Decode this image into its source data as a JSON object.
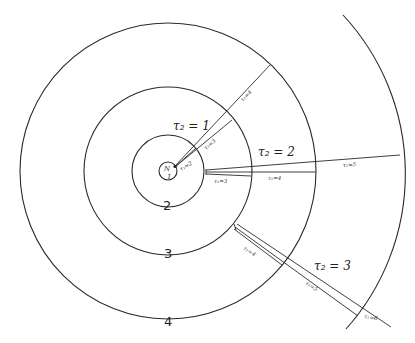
{
  "diagram": {
    "center": [
      168,
      171
    ],
    "circles": [
      {
        "id": "core",
        "r": 9,
        "labels": [
          "N",
          "1"
        ]
      },
      {
        "id": "ring-2",
        "r": 36,
        "label": "2"
      },
      {
        "id": "ring-3",
        "r": 84,
        "label": "3"
      },
      {
        "id": "ring-4",
        "r": 148,
        "label": "4"
      },
      {
        "id": "outer-arc",
        "r": 233
      }
    ],
    "ring_labels": {
      "ring2": "2",
      "ring3": "3",
      "ring4": "4",
      "core_top": "N",
      "core_bottom": "1"
    },
    "regions": {
      "tau2_1": "τ₂ = 1",
      "tau2_2": "τ₂ = 2",
      "tau2_3": "τ₂ = 3"
    },
    "ray_labels": {
      "g1_t2": "τ₁=2",
      "g1_t3": "τ₁=3",
      "g1_t4": "τ₁=4",
      "g2_t3": "τ₁=3",
      "g2_t4": "τ₁=4",
      "g2_t5": "τ₁=5",
      "g3_t4": "τ₁=4",
      "g3_t5": "τ₁=5",
      "g3_t6": "τ₁=6"
    }
  }
}
